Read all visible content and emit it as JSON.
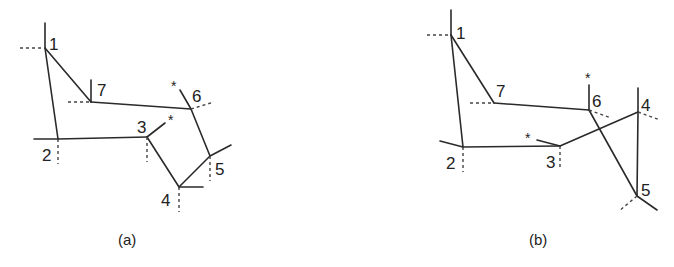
{
  "figure": {
    "panels": [
      {
        "id": "a",
        "caption": "(a)",
        "nodes": [
          {
            "label": "1",
            "x": 45,
            "y": 48
          },
          {
            "label": "2",
            "x": 58,
            "y": 139
          },
          {
            "label": "3",
            "x": 147,
            "y": 137
          },
          {
            "label": "4",
            "x": 179,
            "y": 187
          },
          {
            "label": "5",
            "x": 210,
            "y": 156
          },
          {
            "label": "6",
            "x": 191,
            "y": 109
          },
          {
            "label": "7",
            "x": 91,
            "y": 102
          }
        ],
        "edges": [
          [
            "1",
            "2"
          ],
          [
            "1",
            "7"
          ],
          [
            "7",
            "6"
          ],
          [
            "2",
            "3"
          ],
          [
            "3",
            "4"
          ],
          [
            "4",
            "5"
          ],
          [
            "5",
            "6"
          ]
        ],
        "star_markers": [
          "3",
          "6"
        ]
      },
      {
        "id": "b",
        "caption": "(b)",
        "nodes": [
          {
            "label": "1",
            "x": 451,
            "y": 35
          },
          {
            "label": "2",
            "x": 463,
            "y": 147
          },
          {
            "label": "3",
            "x": 560,
            "y": 146
          },
          {
            "label": "4",
            "x": 638,
            "y": 112
          },
          {
            "label": "5",
            "x": 637,
            "y": 196
          },
          {
            "label": "6",
            "x": 589,
            "y": 110
          },
          {
            "label": "7",
            "x": 494,
            "y": 103
          }
        ],
        "edges": [
          [
            "1",
            "2"
          ],
          [
            "1",
            "7"
          ],
          [
            "7",
            "6"
          ],
          [
            "2",
            "3"
          ],
          [
            "3",
            "4"
          ],
          [
            "4",
            "5"
          ],
          [
            "5",
            "6"
          ]
        ],
        "star_markers": [
          "3",
          "6"
        ]
      }
    ],
    "star_symbol": "*"
  }
}
